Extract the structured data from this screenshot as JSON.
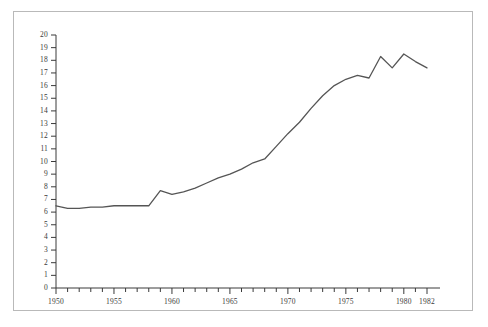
{
  "chart_data": {
    "type": "line",
    "title": "",
    "subtitle": "",
    "xlabel": "",
    "ylabel": "",
    "xlim": [
      1949,
      1983
    ],
    "ylim": [
      0,
      20
    ],
    "grid": false,
    "legend": null,
    "legend_position": "none",
    "series": [
      {
        "name": "series-1",
        "color": "#555555",
        "x": [
          1950,
          1951,
          1952,
          1953,
          1954,
          1955,
          1956,
          1957,
          1958,
          1959,
          1960,
          1961,
          1962,
          1963,
          1964,
          1965,
          1966,
          1967,
          1968,
          1969,
          1970,
          1971,
          1972,
          1973,
          1974,
          1975,
          1976,
          1977,
          1978,
          1979,
          1980,
          1981,
          1982
        ],
        "values": [
          6.5,
          6.3,
          6.3,
          6.4,
          6.4,
          6.5,
          6.5,
          6.5,
          6.5,
          7.7,
          7.4,
          7.6,
          7.9,
          8.3,
          8.7,
          9.0,
          9.4,
          9.9,
          10.2,
          11.2,
          12.2,
          13.1,
          14.2,
          15.2,
          16.0,
          16.5,
          16.8,
          16.6,
          18.3,
          17.4,
          18.5,
          17.9,
          17.4
        ]
      }
    ],
    "x_ticks": [
      1950,
      1951,
      1952,
      1953,
      1954,
      1955,
      1956,
      1957,
      1958,
      1959,
      1960,
      1961,
      1962,
      1963,
      1964,
      1965,
      1966,
      1967,
      1968,
      1969,
      1970,
      1971,
      1972,
      1973,
      1974,
      1975,
      1976,
      1977,
      1978,
      1979,
      1980,
      1981,
      1982
    ],
    "x_tick_labels": [
      {
        "value": 1950,
        "label": "1950"
      },
      {
        "value": 1955,
        "label": "1955"
      },
      {
        "value": 1960,
        "label": "1960"
      },
      {
        "value": 1965,
        "label": "1965"
      },
      {
        "value": 1970,
        "label": "1970"
      },
      {
        "value": 1975,
        "label": "1975"
      },
      {
        "value": 1980,
        "label": "1980"
      },
      {
        "value": 1982,
        "label": "1982"
      }
    ],
    "y_ticks": [
      0,
      1,
      2,
      3,
      4,
      5,
      6,
      7,
      8,
      9,
      10,
      11,
      12,
      13,
      14,
      15,
      16,
      17,
      18,
      19,
      20
    ],
    "y_tick_labels": [
      {
        "value": 0,
        "label": "0"
      },
      {
        "value": 1,
        "label": "1"
      },
      {
        "value": 2,
        "label": "2"
      },
      {
        "value": 3,
        "label": "3"
      },
      {
        "value": 4,
        "label": "4"
      },
      {
        "value": 5,
        "label": "5"
      },
      {
        "value": 6,
        "label": "6"
      },
      {
        "value": 7,
        "label": "7"
      },
      {
        "value": 8,
        "label": "8"
      },
      {
        "value": 9,
        "label": "9"
      },
      {
        "value": 10,
        "label": "10"
      },
      {
        "value": 11,
        "label": "11"
      },
      {
        "value": 12,
        "label": "12"
      },
      {
        "value": 13,
        "label": "13"
      },
      {
        "value": 14,
        "label": "14"
      },
      {
        "value": 15,
        "label": "15"
      },
      {
        "value": 16,
        "label": "16"
      },
      {
        "value": 17,
        "label": "17"
      },
      {
        "value": 18,
        "label": "18"
      },
      {
        "value": 19,
        "label": "19"
      },
      {
        "value": 20,
        "label": "20"
      }
    ]
  },
  "style": {
    "line_color": "#555555",
    "axis_color": "#3a3a3a",
    "frame_color": "#b9b9b9",
    "background": "#ffffff",
    "text_color": "#3a3a3a"
  }
}
